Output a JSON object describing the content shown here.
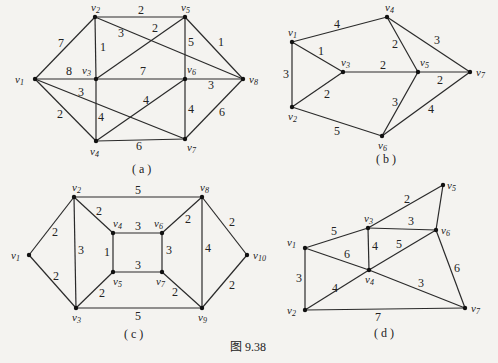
{
  "figure_caption": "图 9.38",
  "graphs": [
    {
      "id": "a",
      "caption": "( a )",
      "nodes": [
        {
          "id": "v1",
          "label": "v1",
          "x": 35,
          "y": 79,
          "lx": -20,
          "ly": 4
        },
        {
          "id": "v2",
          "label": "v2",
          "x": 95,
          "y": 17,
          "lx": -4,
          "ly": -6
        },
        {
          "id": "v3",
          "label": "v3",
          "x": 96,
          "y": 79,
          "lx": -14,
          "ly": -5
        },
        {
          "id": "v4",
          "label": "v4",
          "x": 96,
          "y": 141,
          "lx": -6,
          "ly": 14
        },
        {
          "id": "v5",
          "label": "v5",
          "x": 185,
          "y": 17,
          "lx": -4,
          "ly": -6
        },
        {
          "id": "v6",
          "label": "v6",
          "x": 185,
          "y": 79,
          "lx": 2,
          "ly": -6
        },
        {
          "id": "v7",
          "label": "v7",
          "x": 185,
          "y": 139,
          "lx": 2,
          "ly": 12
        },
        {
          "id": "v8",
          "label": "v8",
          "x": 243,
          "y": 79,
          "lx": 6,
          "ly": 4
        }
      ],
      "edges": [
        {
          "from": "v1",
          "to": "v2",
          "w": "7",
          "lx": 58,
          "ly": 47
        },
        {
          "from": "v1",
          "to": "v3",
          "w": "8",
          "lx": 66,
          "ly": 75
        },
        {
          "from": "v1",
          "to": "v4",
          "w": "2",
          "lx": 57,
          "ly": 118
        },
        {
          "from": "v1",
          "to": "v7",
          "w": "3",
          "lx": 78,
          "ly": 96
        },
        {
          "from": "v2",
          "to": "v5",
          "w": "2",
          "lx": 138,
          "ly": 14
        },
        {
          "from": "v2",
          "to": "v3",
          "w": "1",
          "lx": 100,
          "ly": 51
        },
        {
          "from": "v2",
          "to": "v8",
          "w": "3",
          "lx": 118,
          "ly": 37
        },
        {
          "from": "v3",
          "to": "v5",
          "w": "2",
          "lx": 152,
          "ly": 32
        },
        {
          "from": "v3",
          "to": "v6",
          "w": "7",
          "lx": 140,
          "ly": 75
        },
        {
          "from": "v3",
          "to": "v4",
          "w": "4",
          "lx": 98,
          "ly": 121
        },
        {
          "from": "v5",
          "to": "v6",
          "w": "5",
          "lx": 188,
          "ly": 46
        },
        {
          "from": "v5",
          "to": "v8",
          "w": "1",
          "lx": 218,
          "ly": 46
        },
        {
          "from": "v6",
          "to": "v8",
          "w": "3",
          "lx": 208,
          "ly": 89
        },
        {
          "from": "v6",
          "to": "v4",
          "w": "4",
          "lx": 143,
          "ly": 104
        },
        {
          "from": "v6",
          "to": "v7",
          "w": "4",
          "lx": 188,
          "ly": 113
        },
        {
          "from": "v4",
          "to": "v7",
          "w": "6",
          "lx": 136,
          "ly": 150
        },
        {
          "from": "v7",
          "to": "v8",
          "w": "6",
          "lx": 219,
          "ly": 116
        }
      ]
    },
    {
      "id": "b",
      "caption": "( b )",
      "nodes": [
        {
          "id": "v1",
          "label": "v1",
          "x": 292,
          "y": 42,
          "lx": -4,
          "ly": -6
        },
        {
          "id": "v2",
          "label": "v2",
          "x": 292,
          "y": 107,
          "lx": -4,
          "ly": 13
        },
        {
          "id": "v3",
          "label": "v3",
          "x": 343,
          "y": 72,
          "lx": -2,
          "ly": -6
        },
        {
          "id": "v4",
          "label": "v4",
          "x": 387,
          "y": 17,
          "lx": -2,
          "ly": -6
        },
        {
          "id": "v5",
          "label": "v5",
          "x": 418,
          "y": 72,
          "lx": 2,
          "ly": -6
        },
        {
          "id": "v6",
          "label": "v6",
          "x": 382,
          "y": 136,
          "lx": -4,
          "ly": 13
        },
        {
          "id": "v7",
          "label": "v7",
          "x": 470,
          "y": 72,
          "lx": 6,
          "ly": 4
        }
      ],
      "edges": [
        {
          "from": "v1",
          "to": "v4",
          "w": "4",
          "lx": 334,
          "ly": 28
        },
        {
          "from": "v1",
          "to": "v3",
          "w": "1",
          "lx": 318,
          "ly": 55
        },
        {
          "from": "v1",
          "to": "v2",
          "w": "3",
          "lx": 283,
          "ly": 78
        },
        {
          "from": "v2",
          "to": "v3",
          "w": "2",
          "lx": 324,
          "ly": 98
        },
        {
          "from": "v2",
          "to": "v6",
          "w": "5",
          "lx": 334,
          "ly": 135
        },
        {
          "from": "v3",
          "to": "v5",
          "w": "2",
          "lx": 380,
          "ly": 69
        },
        {
          "from": "v4",
          "to": "v5",
          "w": "2",
          "lx": 392,
          "ly": 48
        },
        {
          "from": "v4",
          "to": "v7",
          "w": "3",
          "lx": 434,
          "ly": 44
        },
        {
          "from": "v5",
          "to": "v7",
          "w": "2",
          "lx": 437,
          "ly": 84
        },
        {
          "from": "v5",
          "to": "v6",
          "w": "3",
          "lx": 392,
          "ly": 106
        },
        {
          "from": "v6",
          "to": "v7",
          "w": "4",
          "lx": 428,
          "ly": 113
        }
      ]
    },
    {
      "id": "c",
      "caption": "( c )",
      "nodes": [
        {
          "id": "v1",
          "label": "v1",
          "x": 29,
          "y": 255,
          "lx": -18,
          "ly": 4
        },
        {
          "id": "v2",
          "label": "v2",
          "x": 74,
          "y": 197,
          "lx": -2,
          "ly": -6
        },
        {
          "id": "v3",
          "label": "v3",
          "x": 76,
          "y": 308,
          "lx": -4,
          "ly": 13
        },
        {
          "id": "v4",
          "label": "v4",
          "x": 113,
          "y": 233,
          "lx": 0,
          "ly": -6
        },
        {
          "id": "v5",
          "label": "v5",
          "x": 113,
          "y": 272,
          "lx": 0,
          "ly": 13
        },
        {
          "id": "v6",
          "label": "v6",
          "x": 162,
          "y": 233,
          "lx": -8,
          "ly": -6
        },
        {
          "id": "v7",
          "label": "v7",
          "x": 162,
          "y": 272,
          "lx": -6,
          "ly": 13
        },
        {
          "id": "v8",
          "label": "v8",
          "x": 202,
          "y": 197,
          "lx": -2,
          "ly": -6
        },
        {
          "id": "v9",
          "label": "v9",
          "x": 202,
          "y": 308,
          "lx": -4,
          "ly": 13
        },
        {
          "id": "v10",
          "label": "v10",
          "x": 247,
          "y": 255,
          "lx": 6,
          "ly": 4
        }
      ],
      "edges": [
        {
          "from": "v1",
          "to": "v2",
          "w": "2",
          "lx": 52,
          "ly": 236
        },
        {
          "from": "v1",
          "to": "v3",
          "w": "2",
          "lx": 53,
          "ly": 280
        },
        {
          "from": "v2",
          "to": "v8",
          "w": "5",
          "lx": 135,
          "ly": 194
        },
        {
          "from": "v2",
          "to": "v3",
          "w": "3",
          "lx": 78,
          "ly": 254
        },
        {
          "from": "v2",
          "to": "v4",
          "w": "2",
          "lx": 96,
          "ly": 215
        },
        {
          "from": "v4",
          "to": "v6",
          "w": "3",
          "lx": 135,
          "ly": 230
        },
        {
          "from": "v4",
          "to": "v5",
          "w": "1",
          "lx": 104,
          "ly": 256
        },
        {
          "from": "v6",
          "to": "v7",
          "w": "3",
          "lx": 166,
          "ly": 254
        },
        {
          "from": "v5",
          "to": "v7",
          "w": "3",
          "lx": 135,
          "ly": 269
        },
        {
          "from": "v3",
          "to": "v5",
          "w": "2",
          "lx": 99,
          "ly": 297
        },
        {
          "from": "v7",
          "to": "v9",
          "w": "2",
          "lx": 172,
          "ly": 296
        },
        {
          "from": "v6",
          "to": "v8",
          "w": "2",
          "lx": 185,
          "ly": 223
        },
        {
          "from": "v8",
          "to": "v9",
          "w": "4",
          "lx": 205,
          "ly": 252
        },
        {
          "from": "v8",
          "to": "v10",
          "w": "2",
          "lx": 229,
          "ly": 226
        },
        {
          "from": "v9",
          "to": "v10",
          "w": "2",
          "lx": 229,
          "ly": 289
        },
        {
          "from": "v3",
          "to": "v9",
          "w": "5",
          "lx": 135,
          "ly": 320
        }
      ]
    },
    {
      "id": "d",
      "caption": "( d )",
      "nodes": [
        {
          "id": "v1",
          "label": "v1",
          "x": 305,
          "y": 248,
          "lx": -18,
          "ly": -2
        },
        {
          "id": "v2",
          "label": "v2",
          "x": 305,
          "y": 310,
          "lx": -18,
          "ly": 4
        },
        {
          "id": "v3",
          "label": "v3",
          "x": 368,
          "y": 228,
          "lx": -4,
          "ly": -6
        },
        {
          "id": "v4",
          "label": "v4",
          "x": 369,
          "y": 270,
          "lx": -4,
          "ly": 13
        },
        {
          "id": "v5",
          "label": "v5",
          "x": 443,
          "y": 185,
          "lx": 4,
          "ly": 4
        },
        {
          "id": "v6",
          "label": "v6",
          "x": 436,
          "y": 230,
          "lx": 5,
          "ly": 4
        },
        {
          "id": "v7",
          "label": "v7",
          "x": 465,
          "y": 308,
          "lx": 6,
          "ly": 4
        }
      ],
      "edges": [
        {
          "from": "v1",
          "to": "v3",
          "w": "5",
          "lx": 331,
          "ly": 235
        },
        {
          "from": "v1",
          "to": "v4",
          "w": "6",
          "lx": 344,
          "ly": 258
        },
        {
          "from": "v1",
          "to": "v2",
          "w": "3",
          "lx": 296,
          "ly": 282
        },
        {
          "from": "v2",
          "to": "v4",
          "w": "4",
          "lx": 332,
          "ly": 292
        },
        {
          "from": "v2",
          "to": "v7",
          "w": "7",
          "lx": 375,
          "ly": 321
        },
        {
          "from": "v3",
          "to": "v5",
          "w": "2",
          "lx": 404,
          "ly": 203
        },
        {
          "from": "v3",
          "to": "v6",
          "w": "3",
          "lx": 408,
          "ly": 225
        },
        {
          "from": "v3",
          "to": "v4",
          "w": "4",
          "lx": 372,
          "ly": 250
        },
        {
          "from": "v4",
          "to": "v6",
          "w": "5",
          "lx": 396,
          "ly": 248
        },
        {
          "from": "v4",
          "to": "v7",
          "w": "3",
          "lx": 418,
          "ly": 287
        },
        {
          "from": "v5",
          "to": "v6",
          "w": "",
          "lx": 0,
          "ly": 0
        },
        {
          "from": "v6",
          "to": "v7",
          "w": "6",
          "lx": 454,
          "ly": 272
        }
      ]
    }
  ],
  "captions_pos": [
    {
      "id": "a",
      "x": 132,
      "y": 173
    },
    {
      "id": "b",
      "x": 376,
      "y": 163
    },
    {
      "id": "c",
      "x": 124,
      "y": 338
    },
    {
      "id": "d",
      "x": 374,
      "y": 337
    }
  ],
  "figure_caption_pos": {
    "x": 230,
    "y": 351
  }
}
